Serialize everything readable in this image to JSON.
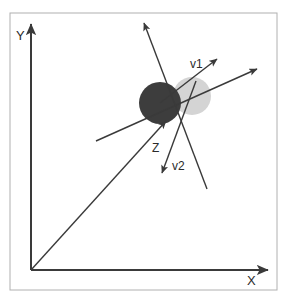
{
  "figure": {
    "background_color": "#ffffff",
    "frame": {
      "name": "plot-frame",
      "x": 10,
      "y": 13,
      "width": 267,
      "height": 277,
      "stroke": "#b0b0b0",
      "stroke_width": 1
    }
  },
  "axes": {
    "origin": {
      "x": 31,
      "y": 270
    },
    "stroke": "#3a3a3a",
    "stroke_width": 2,
    "y_axis": {
      "label": "Y",
      "label_x": 16,
      "label_y": 40,
      "tip_x": 31,
      "tip_y": 24
    },
    "x_axis": {
      "label": "X",
      "label_x": 247,
      "label_y": 285,
      "tip_x": 268,
      "tip_y": 270
    }
  },
  "circles": [
    {
      "name": "dark-sphere",
      "cx": 160,
      "cy": 103,
      "r": 21,
      "fill": "#3d3d3d",
      "opacity": 1
    },
    {
      "name": "light-sphere",
      "cx": 192,
      "cy": 96,
      "r": 19,
      "fill": "#d4d4d4",
      "opacity": 1
    }
  ],
  "vectors": [
    {
      "name": "vector-z",
      "label": "Z",
      "label_x": 152,
      "label_y": 152,
      "x1": 31,
      "y1": 270,
      "x2": 166,
      "y2": 121,
      "arrow": true,
      "stroke": "#3a3a3a",
      "stroke_width": 1.4
    },
    {
      "name": "vector-v1",
      "label": "v1",
      "label_x": 190,
      "label_y": 68,
      "x1": 160,
      "y1": 103,
      "x2": 217,
      "y2": 59,
      "arrow": true,
      "stroke": "#3a3a3a",
      "stroke_width": 1.4
    },
    {
      "name": "vector-v2",
      "label": "v2",
      "label_x": 172,
      "label_y": 170,
      "x1": 196,
      "y1": 81,
      "x2": 162,
      "y2": 173,
      "arrow": true,
      "stroke": "#3a3a3a",
      "stroke_width": 1.4
    },
    {
      "name": "vector-steep-up",
      "label": "",
      "x1": 207,
      "y1": 189,
      "x2": 144,
      "y2": 23,
      "arrow": true,
      "stroke": "#3a3a3a",
      "stroke_width": 1.4
    },
    {
      "name": "vector-long-right",
      "label": "",
      "x1": 96,
      "y1": 141,
      "x2": 257,
      "y2": 69,
      "arrow": true,
      "stroke": "#3a3a3a",
      "stroke_width": 1.4
    }
  ],
  "labels": {
    "y_axis_label": "Y",
    "x_axis_label": "X",
    "z_label": "Z",
    "v1_label": "v1",
    "v2_label": "v2"
  }
}
